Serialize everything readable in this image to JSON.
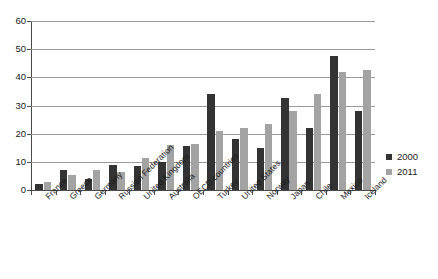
{
  "chart_data": {
    "type": "bar",
    "title": "",
    "subtitle": "",
    "xlabel": "",
    "ylabel": "",
    "ylim": [
      0,
      60
    ],
    "ytick_step": 10,
    "yticks": [
      0,
      10,
      20,
      30,
      40,
      50,
      60
    ],
    "grid": true,
    "grid_axis": "y",
    "legend_position": "right",
    "categories": [
      "France",
      "Greece",
      "Germany",
      "Russian Federation",
      "United Kingdom",
      "Australia",
      "OECD countries",
      "Turkey",
      "United States",
      "Norway",
      "Japan",
      "Chile",
      "Mexico",
      "Iceland"
    ],
    "series": [
      {
        "name": "2000",
        "color": "#333333",
        "values": [
          2,
          7,
          4,
          9,
          8.5,
          10,
          15.5,
          34,
          18,
          15,
          32.5,
          22,
          47.5,
          28
        ]
      },
      {
        "name": "2011",
        "color": "#a3a3a3",
        "values": [
          3,
          5.5,
          7,
          6.5,
          11.5,
          16,
          16.5,
          21,
          22,
          23.5,
          28,
          34,
          42,
          42.5
        ]
      }
    ]
  },
  "legend": {
    "entries": [
      {
        "label": "2000",
        "color": "#333333"
      },
      {
        "label": "2011",
        "color": "#a3a3a3"
      }
    ]
  },
  "axis": {
    "y_labels": [
      "60",
      "50",
      "40",
      "30",
      "20",
      "10",
      "0"
    ],
    "x_labels": [
      "France",
      "Greece",
      "Germany",
      "Russian Federation",
      "United Kingdom",
      "Australia",
      "OECD countries",
      "Turkey",
      "United States",
      "Norway",
      "Japan",
      "Chile",
      "Mexico",
      "Iceland"
    ]
  },
  "colors": {
    "series_2000": "#333333",
    "series_2011": "#a3a3a3",
    "grid": "#9a9a9a",
    "axis": "#4a4a4a",
    "background": "#ffffff",
    "text": "#1a1a1a"
  }
}
